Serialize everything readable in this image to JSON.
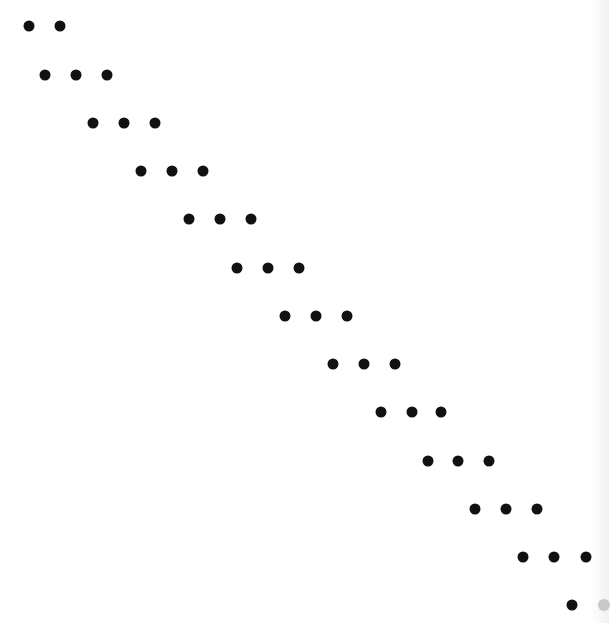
{
  "diagram": {
    "type": "sparsity-pattern",
    "matrix_size": 13,
    "colors": {
      "background": "#ffffff",
      "dot": "#111111",
      "dot_faded": "#c8c8c8"
    },
    "rows": [
      {
        "row": 1,
        "y": 26,
        "dots": [
          {
            "x": 29
          },
          {
            "x": 60
          }
        ]
      },
      {
        "row": 2,
        "y": 75,
        "dots": [
          {
            "x": 45
          },
          {
            "x": 76
          },
          {
            "x": 107
          }
        ]
      },
      {
        "row": 3,
        "y": 123,
        "dots": [
          {
            "x": 93
          },
          {
            "x": 124
          },
          {
            "x": 155
          }
        ]
      },
      {
        "row": 4,
        "y": 171,
        "dots": [
          {
            "x": 141
          },
          {
            "x": 172
          },
          {
            "x": 203
          }
        ]
      },
      {
        "row": 5,
        "y": 219,
        "dots": [
          {
            "x": 189
          },
          {
            "x": 220
          },
          {
            "x": 251
          }
        ]
      },
      {
        "row": 6,
        "y": 268,
        "dots": [
          {
            "x": 237
          },
          {
            "x": 268
          },
          {
            "x": 299
          }
        ]
      },
      {
        "row": 7,
        "y": 316,
        "dots": [
          {
            "x": 285
          },
          {
            "x": 316
          },
          {
            "x": 347
          }
        ]
      },
      {
        "row": 8,
        "y": 364,
        "dots": [
          {
            "x": 333
          },
          {
            "x": 364
          },
          {
            "x": 395
          }
        ]
      },
      {
        "row": 9,
        "y": 412,
        "dots": [
          {
            "x": 381
          },
          {
            "x": 412
          },
          {
            "x": 441
          }
        ]
      },
      {
        "row": 10,
        "y": 461,
        "dots": [
          {
            "x": 428
          },
          {
            "x": 458
          },
          {
            "x": 489
          }
        ]
      },
      {
        "row": 11,
        "y": 509,
        "dots": [
          {
            "x": 475
          },
          {
            "x": 506
          },
          {
            "x": 537
          }
        ]
      },
      {
        "row": 12,
        "y": 557,
        "dots": [
          {
            "x": 523
          },
          {
            "x": 554
          },
          {
            "x": 586
          }
        ]
      },
      {
        "row": 13,
        "y": 605,
        "dots": [
          {
            "x": 572
          },
          {
            "x": 604,
            "faded": true
          }
        ]
      }
    ]
  }
}
